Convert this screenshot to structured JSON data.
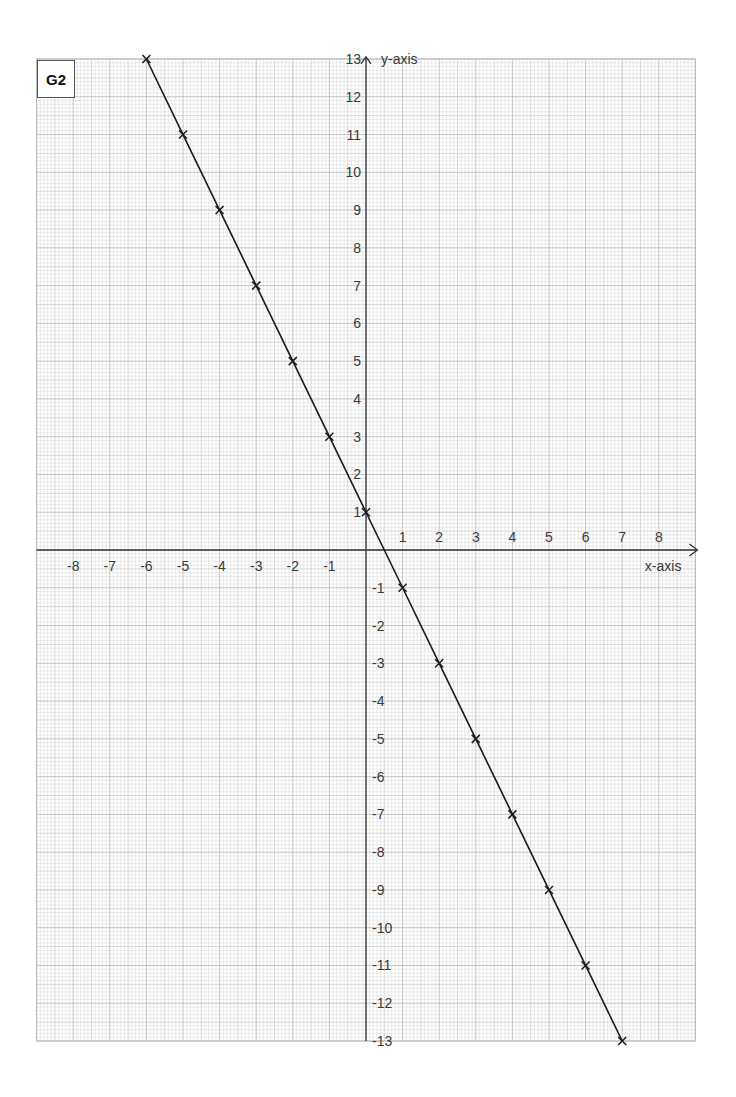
{
  "figure": {
    "tag": "G2"
  },
  "chart_data": {
    "type": "line",
    "title": "",
    "tag": "G2",
    "xlabel": "x-axis",
    "ylabel": "y-axis",
    "xlim": [
      -9,
      9
    ],
    "ylim": [
      -13,
      13
    ],
    "grid": true,
    "grid_style": "graph paper: major line each unit, minor lines every 0.1 unit, medium line at 0.5",
    "x_tick_labels": [
      "-8",
      "-7",
      "-6",
      "-5",
      "-4",
      "-3",
      "-2",
      "-1",
      "1",
      "2",
      "3",
      "4",
      "5",
      "6",
      "7",
      "8"
    ],
    "y_tick_labels": [
      "13",
      "12",
      "11",
      "10",
      "9",
      "8",
      "7",
      "6",
      "5",
      "4",
      "3",
      "2",
      "1",
      "-1",
      "-2",
      "-3",
      "-4",
      "-5",
      "-6",
      "-7",
      "-8",
      "-9",
      "-10",
      "-11",
      "-12",
      "-13"
    ],
    "x_ticks": [
      -8,
      -7,
      -6,
      -5,
      -4,
      -3,
      -2,
      -1,
      1,
      2,
      3,
      4,
      5,
      6,
      7,
      8
    ],
    "y_ticks": [
      13,
      12,
      11,
      10,
      9,
      8,
      7,
      6,
      5,
      4,
      3,
      2,
      1,
      -1,
      -2,
      -3,
      -4,
      -5,
      -6,
      -7,
      -8,
      -9,
      -10,
      -11,
      -12,
      -13
    ],
    "series": [
      {
        "name": "y = -2x + 1",
        "marker": "x",
        "color": "#1a1a1a",
        "x": [
          -6,
          -5,
          -4,
          -3,
          -2,
          -1,
          0,
          1,
          2,
          3,
          4,
          5,
          6,
          7
        ],
        "y": [
          13,
          11,
          9,
          7,
          5,
          3,
          1,
          -1,
          -3,
          -5,
          -7,
          -9,
          -11,
          -13
        ]
      }
    ],
    "legend": null
  },
  "colors": {
    "minor_grid": "#e4e4e4",
    "half_grid": "#cfcfcf",
    "major_grid": "#b8b8b8",
    "axis": "#333333",
    "line": "#1a1a1a",
    "text": "#3a3a3a"
  }
}
